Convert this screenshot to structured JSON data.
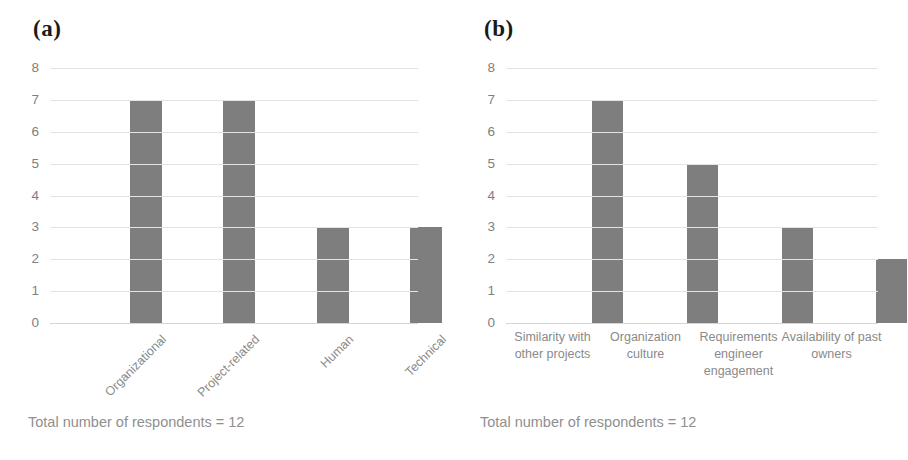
{
  "figure": {
    "background": "#ffffff",
    "bar_color": "#7e7e7e",
    "gridline_color": "#e3e3e3",
    "label_color": "#8a8a8a",
    "tick_color": "#7f7f7f"
  },
  "panels": [
    {
      "tag": "(a)",
      "caption": "Total number of respondents = 12",
      "label_style": "rotated",
      "chart_data": {
        "type": "bar",
        "title": "(a)",
        "xlabel": "",
        "ylabel": "",
        "ylim": [
          0,
          8
        ],
        "yticks": [
          0,
          1,
          2,
          3,
          4,
          5,
          6,
          7,
          8
        ],
        "ytick_labels": [
          "0",
          "1",
          "2",
          "3",
          "4",
          "5",
          "6",
          "7",
          "8"
        ],
        "grid": true,
        "legend": "none",
        "categories": [
          "Organizational",
          "Project-related",
          "Human",
          "Technical"
        ],
        "values": [
          7,
          7,
          3,
          3
        ],
        "annotations": [
          "Total number of respondents = 12"
        ]
      }
    },
    {
      "tag": "(b)",
      "caption": "Total number of respondents = 12",
      "label_style": "wrapped",
      "chart_data": {
        "type": "bar",
        "title": "(b)",
        "xlabel": "",
        "ylabel": "",
        "ylim": [
          0,
          8
        ],
        "yticks": [
          0,
          1,
          2,
          3,
          4,
          5,
          6,
          7,
          8
        ],
        "ytick_labels": [
          "0",
          "1",
          "2",
          "3",
          "4",
          "5",
          "6",
          "7",
          "8"
        ],
        "grid": true,
        "legend": "none",
        "categories": [
          "Similarity with other projects",
          "Organization culture",
          "Requirements engineer engagement",
          "Availability of past owners"
        ],
        "values": [
          7,
          5,
          3,
          2
        ],
        "annotations": [
          "Total number of respondents = 12"
        ]
      }
    }
  ]
}
